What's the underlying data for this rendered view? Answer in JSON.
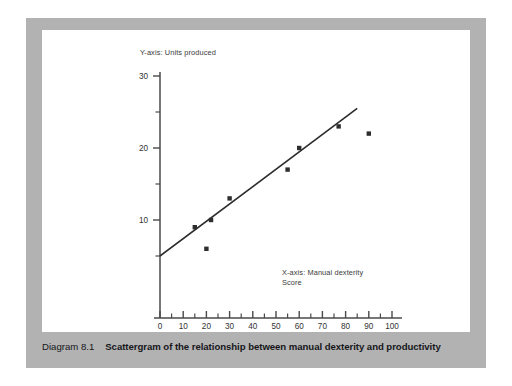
{
  "figure": {
    "caption_number": "Diagram 8.1",
    "caption_text": "Scattergram of the relationship between manual dexterity and productivity",
    "panel_background": "#ffffff",
    "frame_color": "#b2b2b2"
  },
  "chart_data": {
    "type": "scatter",
    "title": "",
    "xlabel": "X-axis: Manual dexterity\nScore",
    "ylabel": "Y-axis: Units produced",
    "xlim": [
      0,
      100
    ],
    "ylim": [
      0,
      30
    ],
    "xticks": [
      0,
      10,
      20,
      30,
      40,
      50,
      60,
      70,
      80,
      90,
      100
    ],
    "xtick_labels": [
      "0",
      "10",
      "20",
      "30",
      "40",
      "50",
      "60",
      "70",
      "80",
      "90",
      "100"
    ],
    "xminor_ticks": [
      5,
      15,
      25,
      35,
      45,
      55,
      65,
      75,
      85,
      95
    ],
    "yticks": [
      10,
      20,
      30
    ],
    "ytick_labels": [
      "10",
      "20",
      "30"
    ],
    "yminor_ticks": [
      5,
      15,
      25
    ],
    "grid": false,
    "legend": null,
    "marker": "square",
    "marker_color": "#2e2e2e",
    "points": [
      {
        "x": 15,
        "y": 9
      },
      {
        "x": 20,
        "y": 6
      },
      {
        "x": 22,
        "y": 10
      },
      {
        "x": 30,
        "y": 13
      },
      {
        "x": 55,
        "y": 17
      },
      {
        "x": 60,
        "y": 20
      },
      {
        "x": 77,
        "y": 23
      },
      {
        "x": 90,
        "y": 22
      }
    ],
    "trendline": {
      "label": "best fit line",
      "x_start": 0,
      "y_start": 5,
      "x_end": 85,
      "y_end": 25.5,
      "color": "#2b2b2b"
    }
  }
}
